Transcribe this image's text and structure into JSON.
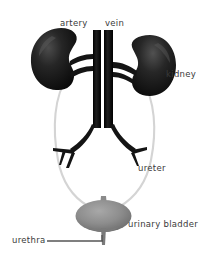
{
  "figure": {
    "name": "urinary-system-diagram",
    "background_color": "#ffffff",
    "width": 219,
    "height": 256
  },
  "labels": {
    "artery": "artery",
    "vein": "vein",
    "kidney": "kidney",
    "ureter": "ureter",
    "urinary_bladder": "urinary bladder",
    "urethra": "urethra"
  },
  "colors": {
    "label_text": "#3a3a3a",
    "vessel": "#141414",
    "kidney": "#1a1a1a",
    "kidney_highlight": "#4a4a4a",
    "bladder": "#8f8f8f",
    "bladder_shadow": "#6e6e6e",
    "ureter": "#d2d2d2",
    "leader_line": "#555555",
    "background": "#ffffff"
  },
  "parts": [
    {
      "id": "left-kidney",
      "name": "kidney",
      "side": "left",
      "shape": "bean",
      "fill": "#1a1a1a"
    },
    {
      "id": "right-kidney",
      "name": "kidney",
      "side": "right",
      "shape": "bean",
      "fill": "#1a1a1a"
    },
    {
      "id": "aorta",
      "name": "artery",
      "side": "center",
      "shape": "vertical-vessel",
      "fill": "#141414"
    },
    {
      "id": "vena-cava",
      "name": "vein",
      "side": "center",
      "shape": "vertical-vessel",
      "fill": "#141414"
    },
    {
      "id": "left-ureter",
      "name": "ureter",
      "side": "left",
      "shape": "curve",
      "fill": "#d2d2d2"
    },
    {
      "id": "right-ureter",
      "name": "ureter",
      "side": "right",
      "shape": "curve",
      "fill": "#d2d2d2"
    },
    {
      "id": "urinary-bladder",
      "name": "urinary bladder",
      "side": "center",
      "shape": "oval",
      "fill": "#8f8f8f"
    },
    {
      "id": "urethra",
      "name": "urethra",
      "side": "center",
      "shape": "tube",
      "fill": "#6e6e6e"
    }
  ]
}
